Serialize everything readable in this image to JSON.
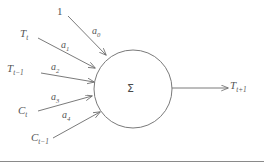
{
  "diagram": {
    "type": "artificial-neuron",
    "node": {
      "symbol": "Σ",
      "cx": 133,
      "cy": 89,
      "r": 39
    },
    "inputs": [
      {
        "id": "bias",
        "label": "1",
        "sub": "",
        "label_x": 57,
        "label_y": 6,
        "weight": "a",
        "weight_sub": "0",
        "weight_x": 92,
        "weight_y": 26,
        "from_x": 68,
        "from_y": 16,
        "to_x": 106,
        "to_y": 55
      },
      {
        "id": "t-t",
        "label": "T",
        "sub": "t",
        "label_x": 20,
        "label_y": 28,
        "weight": "a",
        "weight_sub": "1",
        "weight_x": 61,
        "weight_y": 40,
        "from_x": 38,
        "from_y": 38,
        "to_x": 95,
        "to_y": 68
      },
      {
        "id": "t-tm1",
        "label": "T",
        "sub": "t−1",
        "label_x": 7,
        "label_y": 63,
        "weight": "a",
        "weight_sub": "2",
        "weight_x": 51,
        "weight_y": 62,
        "from_x": 41,
        "from_y": 73,
        "to_x": 94,
        "to_y": 82
      },
      {
        "id": "c-t",
        "label": "C",
        "sub": "t",
        "label_x": 18,
        "label_y": 105,
        "weight": "a",
        "weight_sub": "3",
        "weight_x": 51,
        "weight_y": 92,
        "from_x": 38,
        "from_y": 111,
        "to_x": 92,
        "to_y": 96
      },
      {
        "id": "c-tm1",
        "label": "C",
        "sub": "t−1",
        "label_x": 31,
        "label_y": 132,
        "weight": "a",
        "weight_sub": "4",
        "weight_x": 62,
        "weight_y": 110,
        "from_x": 53,
        "from_y": 138,
        "to_x": 100,
        "to_y": 112
      }
    ],
    "output": {
      "label": "T",
      "sub": "t+1",
      "label_x": 230,
      "label_y": 80,
      "from_x": 172,
      "from_y": 88,
      "to_x": 228,
      "to_y": 88
    },
    "colors": {
      "stroke": "#6b6b6b",
      "node_stroke": "#7a7a7a",
      "text": "#555555",
      "background": "#ffffff",
      "rule": "#8a8a8a"
    }
  }
}
